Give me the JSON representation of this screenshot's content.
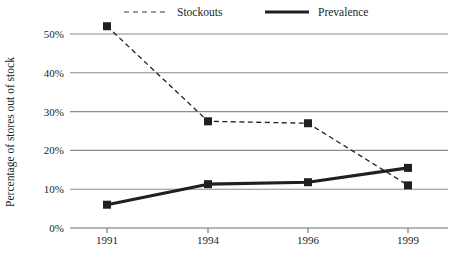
{
  "chart_data": {
    "type": "line",
    "title": "",
    "xlabel": "",
    "ylabel": "Percentage of stores out of stock",
    "categories": [
      "1991",
      "1994",
      "1996",
      "1999"
    ],
    "x_tick_labels": [
      "1991",
      "1994",
      "1996",
      "1999"
    ],
    "y_tick_labels": [
      "0%",
      "10%",
      "20%",
      "30%",
      "40%",
      "50%"
    ],
    "y_tick_values": [
      0,
      10,
      20,
      30,
      40,
      50
    ],
    "ylim": [
      0,
      55
    ],
    "grid": "horizontal",
    "legend_position": "top",
    "series": [
      {
        "name": "Stockouts",
        "style": "dashed",
        "marker": "square",
        "color": "#231f20",
        "values": [
          52,
          27.5,
          27,
          11
        ]
      },
      {
        "name": "Prevalence",
        "style": "solid",
        "marker": "square",
        "color": "#231f20",
        "values": [
          6,
          11.3,
          11.8,
          15.5
        ]
      }
    ]
  },
  "legend": {
    "items": [
      {
        "label": "Stockouts",
        "swatch": "dashed-line-swatch"
      },
      {
        "label": "Prevalence",
        "swatch": "solid-line-swatch"
      }
    ]
  },
  "axes": {
    "y_title": "Percentage of stores out of stock"
  },
  "colors": {
    "ink": "#231f20",
    "gridline": "#8c8c8c",
    "axis": "#6e6e6e",
    "background": "#ffffff"
  }
}
